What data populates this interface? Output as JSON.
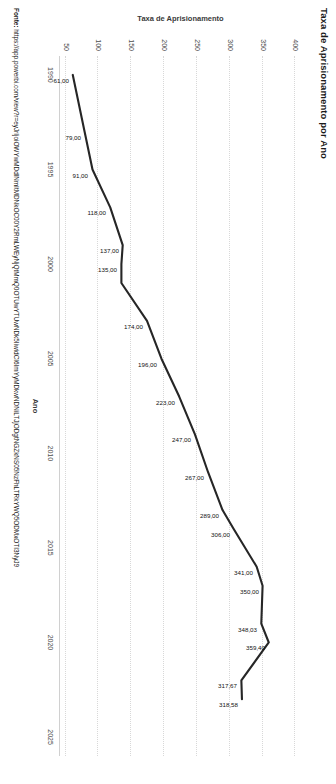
{
  "chart_data": {
    "type": "line",
    "title": "Taxa de Aprisionamento por Ano",
    "xlabel": "Ano",
    "ylabel": "Taxa de Aprisionamento",
    "xlim": [
      1989,
      2026
    ],
    "ylim": [
      40,
      410
    ],
    "xticks": [
      "1990",
      "1995",
      "2000",
      "2005",
      "2010",
      "2015",
      "2020",
      "2025"
    ],
    "xtickvalues": [
      1990,
      1995,
      2000,
      2005,
      2010,
      2015,
      2020,
      2025
    ],
    "yticks": [
      "50",
      "100",
      "150",
      "200",
      "250",
      "300",
      "350",
      "400"
    ],
    "ytickvalues": [
      50,
      100,
      150,
      200,
      250,
      300,
      350,
      400
    ],
    "grid": true,
    "legend": "none",
    "series": [
      {
        "name": "Taxa de Aprisionamento",
        "x": [
          1990,
          1993,
          1995,
          1997,
          1999,
          2000,
          2001,
          2003,
          2005,
          2007,
          2009,
          2011,
          2013,
          2014,
          2016,
          2017,
          2019,
          2020,
          2022,
          2023
        ],
        "values": [
          61.0,
          79.0,
          91.0,
          118.0,
          137.0,
          135.0,
          135.0,
          174.0,
          196.0,
          223.0,
          247.0,
          267.0,
          289.0,
          306.0,
          341.0,
          350.0,
          348.03,
          359.4,
          317.67,
          318.58
        ],
        "labels": [
          "61,00",
          "79,00",
          "91,00",
          "118,00",
          "137,00",
          "135,00",
          "",
          "174,00",
          "196,00",
          "223,00",
          "247,00",
          "267,00",
          "289,00",
          "306,00",
          "341,00",
          "350,00",
          "348,03",
          "359,40",
          "317,67",
          "318,58"
        ],
        "color": "#262626"
      }
    ]
  },
  "source": {
    "label": "Fonte:",
    "url": "https://app.powerbi.com/view?r=eyJrIjoiOWYwMDdlNmItMDNkOC00Y2RmLWEyNjQtMmQ0OTUwYTUwNDk5IiwidCI6ImYyMDkwNDNiLTJjODgtNGZkNS05NzFhLTRkYWQ5ODMxOTI3NyJ9"
  }
}
